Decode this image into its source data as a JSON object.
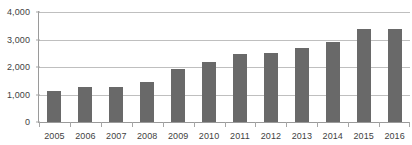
{
  "chart_data": {
    "type": "bar",
    "title": "",
    "subtitle": "",
    "xlabel": "",
    "ylabel": "",
    "categories": [
      "2005",
      "2006",
      "2007",
      "2008",
      "2009",
      "2010",
      "2011",
      "2012",
      "2013",
      "2014",
      "2015",
      "2016"
    ],
    "values": [
      1120,
      1290,
      1270,
      1440,
      1920,
      2170,
      2480,
      2520,
      2700,
      2900,
      3380,
      3400
    ],
    "series": [
      {
        "name": "",
        "values": [
          1120,
          1290,
          1270,
          1440,
          1920,
          2170,
          2480,
          2520,
          2700,
          2900,
          3380,
          3400
        ]
      }
    ],
    "ylim": [
      0,
      4000
    ],
    "ytick_values": [
      0,
      1000,
      2000,
      3000,
      4000
    ],
    "ytick_labels": [
      "0",
      "1,000",
      "2,000",
      "3,000",
      "4,000"
    ],
    "grid": true,
    "grid_axis": "y",
    "legend": false,
    "legend_position": "none",
    "annotations": [],
    "colors": {
      "bar": "#696969",
      "gridline": "#bfbfbf",
      "axis": "#9a9a9a",
      "tick_label": "#3f3f3f",
      "background": "#ffffff"
    }
  }
}
